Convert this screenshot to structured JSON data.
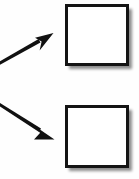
{
  "canvas": {
    "width": 139,
    "height": 179,
    "background_color": "#fefefe",
    "title": "Two arrows pointing to two empty squares"
  },
  "style": {
    "stroke_color": "#141414",
    "box_fill_color": "#ffffff",
    "box_border_color": "#141414",
    "box_border_width": 3,
    "shadow_color": "#c8c8c8",
    "arrow_color": "#111111"
  },
  "shapes": {
    "boxes": [
      {
        "name": "top-square",
        "label": "",
        "x": 65,
        "y": 4,
        "width": 64,
        "height": 62,
        "border_width": 3,
        "fill": "#ffffff",
        "border_color": "#141414",
        "shadow_offset_x": 3,
        "shadow_offset_y": 3
      },
      {
        "name": "bottom-square",
        "label": "",
        "x": 65,
        "y": 105,
        "width": 64,
        "height": 63,
        "border_width": 3,
        "fill": "#ffffff",
        "border_color": "#141414",
        "shadow_offset_x": 3,
        "shadow_offset_y": 3
      }
    ],
    "arrows": [
      {
        "name": "upper-arrow",
        "label": "",
        "direction": "up-right",
        "from_x": -2,
        "from_y": 65,
        "to_x": 53,
        "to_y": 34,
        "target": "top-square",
        "head_length": 17,
        "head_width": 11,
        "line_width": 3
      },
      {
        "name": "lower-arrow",
        "label": "",
        "direction": "down-right",
        "from_x": -2,
        "from_y": 102,
        "to_x": 54,
        "to_y": 139,
        "target": "bottom-square",
        "head_length": 17,
        "head_width": 11,
        "line_width": 3
      }
    ]
  }
}
